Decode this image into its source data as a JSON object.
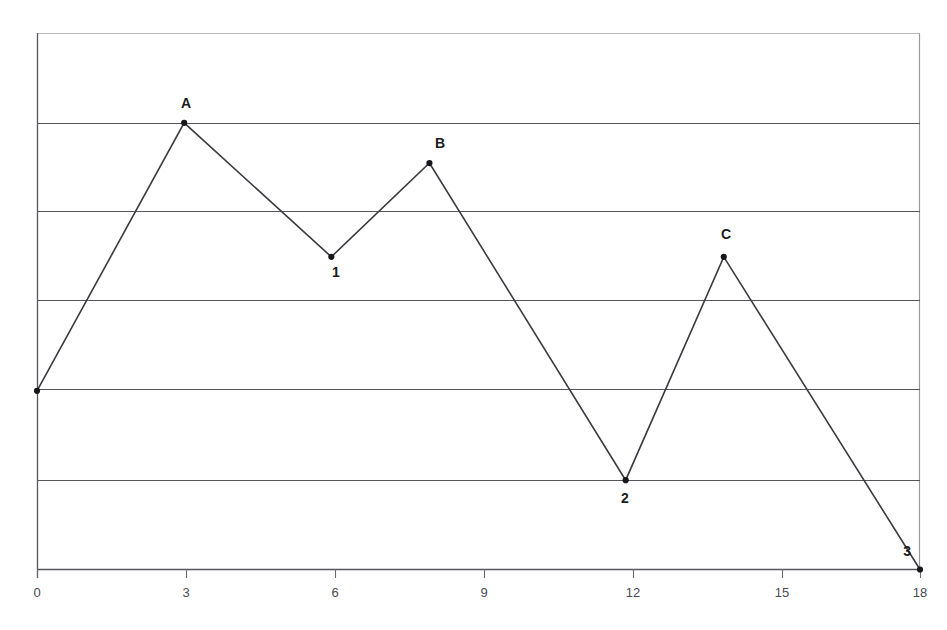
{
  "chart_data": {
    "type": "line",
    "title": "",
    "xlabel": "",
    "ylabel": "",
    "grid": "horizontal",
    "legend": "none",
    "xlim": [
      0,
      18
    ],
    "ylim": [
      0,
      6
    ],
    "xticks": [
      0,
      3,
      6,
      9,
      12,
      15,
      18
    ],
    "xtick_labels": [
      "0",
      "3",
      "6",
      "9",
      "12",
      "15",
      "18"
    ],
    "yticks": [
      0,
      1,
      2,
      3,
      4,
      5,
      6
    ],
    "ytick_labels": [
      "",
      "",
      "",
      "",
      "",
      "",
      ""
    ],
    "series": [
      {
        "name": "path",
        "x": [
          0,
          3,
          6,
          8,
          12,
          14,
          18
        ],
        "y": [
          2.0,
          5.0,
          3.5,
          4.55,
          1.0,
          3.5,
          0.0
        ],
        "point_labels": [
          "",
          "A",
          "1",
          "B",
          "2",
          "C",
          "3"
        ],
        "marker": "dot",
        "line_color": "#3a3a42",
        "marker_color": "#17171c"
      }
    ],
    "annotations": [
      {
        "text": "A",
        "x": 3,
        "y": 5.0,
        "position": "above"
      },
      {
        "text": "1",
        "x": 6,
        "y": 3.5,
        "position": "below"
      },
      {
        "text": "B",
        "x": 8,
        "y": 4.55,
        "position": "above"
      },
      {
        "text": "2",
        "x": 12,
        "y": 1.0,
        "position": "below"
      },
      {
        "text": "C",
        "x": 14,
        "y": 3.5,
        "position": "above"
      },
      {
        "text": "3",
        "x": 18,
        "y": 0.0,
        "position": "above-left"
      }
    ]
  },
  "axis": {
    "x_tick_0": "0",
    "x_tick_1": "3",
    "x_tick_2": "6",
    "x_tick_3": "9",
    "x_tick_4": "12",
    "x_tick_5": "15",
    "x_tick_6": "18"
  },
  "labels": {
    "peak_a": "A",
    "trough_1": "1",
    "peak_b": "B",
    "trough_2": "2",
    "peak_c": "C",
    "end_3": "3"
  },
  "colors": {
    "line": "#3a3a42",
    "marker": "#17171c",
    "gridline": "#55555c",
    "axis": "#55555c",
    "border_faint": "#b9b9c0",
    "tick_text": "#4a4a52",
    "background": "#ffffff"
  }
}
